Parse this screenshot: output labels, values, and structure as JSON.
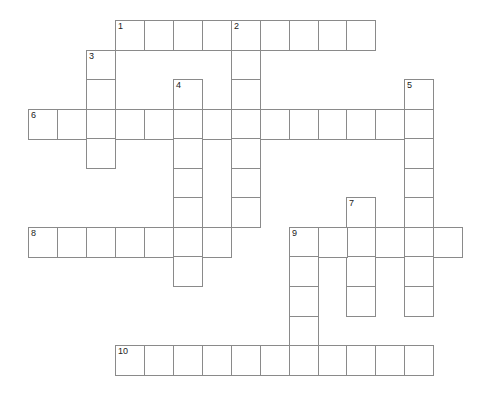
{
  "crossword": {
    "cell_size": 29,
    "origin": {
      "x": 28,
      "y": 20
    },
    "row_step": 29.55,
    "col_step": 28.95,
    "line_color": "#8a8a8a",
    "words": [
      {
        "number": "1",
        "direction": "across",
        "row": 0,
        "col": 3,
        "length": 9
      },
      {
        "number": "2",
        "direction": "down",
        "row": 0,
        "col": 7,
        "length": 7
      },
      {
        "number": "3",
        "direction": "down",
        "row": 1,
        "col": 2,
        "length": 4
      },
      {
        "number": "4",
        "direction": "down",
        "row": 2,
        "col": 5,
        "length": 7
      },
      {
        "number": "5",
        "direction": "down",
        "row": 2,
        "col": 13,
        "length": 8
      },
      {
        "number": "6",
        "direction": "across",
        "row": 3,
        "col": 0,
        "length": 14
      },
      {
        "number": "7",
        "direction": "down",
        "row": 6,
        "col": 11,
        "length": 4
      },
      {
        "number": "8",
        "direction": "across",
        "row": 7,
        "col": 0,
        "length": 7
      },
      {
        "number": "9",
        "direction": "across",
        "row": 7,
        "col": 9,
        "length": 6
      },
      {
        "number": "9",
        "direction": "down",
        "row": 7,
        "col": 9,
        "length": 5
      },
      {
        "number": "10",
        "direction": "across",
        "row": 11,
        "col": 3,
        "length": 11
      }
    ]
  }
}
